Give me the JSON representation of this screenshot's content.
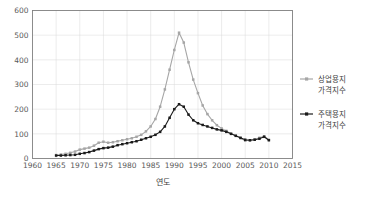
{
  "chart_data": {
    "type": "line",
    "title": "",
    "xlabel": "연도",
    "ylabel": "",
    "xlim": [
      1960,
      2015
    ],
    "ylim": [
      0,
      600
    ],
    "xticks": [
      1960,
      1965,
      1970,
      1975,
      1980,
      1985,
      1990,
      1995,
      2000,
      2005,
      2010,
      2015
    ],
    "yticks": [
      0,
      100,
      200,
      300,
      400,
      500,
      600
    ],
    "grid": true,
    "legend_position": "right",
    "x": [
      1965,
      1966,
      1967,
      1968,
      1969,
      1970,
      1971,
      1972,
      1973,
      1974,
      1975,
      1976,
      1977,
      1978,
      1979,
      1980,
      1981,
      1982,
      1983,
      1984,
      1985,
      1986,
      1987,
      1988,
      1989,
      1990,
      1991,
      1992,
      1993,
      1994,
      1995,
      1996,
      1997,
      1998,
      1999,
      2000,
      2001,
      2002,
      2003,
      2004,
      2005,
      2006,
      2007,
      2008,
      2009,
      2010
    ],
    "series": [
      {
        "name": "상업용지 가격지수",
        "color": "#a6a6a6",
        "marker": "square",
        "values": [
          14,
          16,
          19,
          23,
          28,
          36,
          40,
          44,
          52,
          64,
          68,
          64,
          66,
          70,
          74,
          78,
          82,
          88,
          96,
          110,
          130,
          160,
          210,
          280,
          360,
          440,
          510,
          470,
          390,
          320,
          265,
          215,
          180,
          155,
          135,
          122,
          112,
          100,
          92,
          82,
          72,
          74,
          78,
          84,
          90,
          76
        ]
      },
      {
        "name": "주택용지 가격지수",
        "color": "#1a1a1a",
        "marker": "square",
        "values": [
          12,
          12,
          13,
          14,
          15,
          19,
          22,
          26,
          32,
          38,
          42,
          44,
          48,
          54,
          58,
          62,
          66,
          70,
          76,
          82,
          88,
          96,
          108,
          130,
          165,
          200,
          220,
          210,
          178,
          155,
          143,
          136,
          130,
          124,
          118,
          114,
          108,
          100,
          92,
          84,
          76,
          74,
          76,
          80,
          88,
          74
        ]
      }
    ]
  },
  "legend": {
    "entries": [
      {
        "line1": "상업용지",
        "line2": "가격지수"
      },
      {
        "line1": "주택용지",
        "line2": "가격지수"
      }
    ]
  },
  "axis": {
    "x_title": "연도"
  }
}
